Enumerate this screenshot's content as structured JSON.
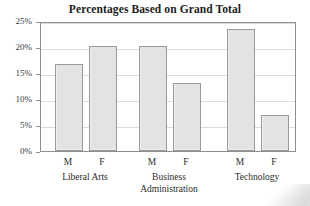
{
  "chart_data": {
    "type": "bar",
    "title": "Percentages Based on Grand Total",
    "xlabel": "",
    "ylabel": "",
    "ylim": [
      0,
      25
    ],
    "grid": true,
    "legend": "none",
    "categories": [
      "M",
      "F",
      "M",
      "F",
      "M",
      "F"
    ],
    "values": [
      16.8,
      20.1,
      20.1,
      13.0,
      23.4,
      7.0
    ],
    "groups": [
      {
        "label": "Liberal Arts",
        "bars": [
          {
            "label": "M",
            "value": 16.8
          },
          {
            "label": "F",
            "value": 20.1
          }
        ]
      },
      {
        "label": "Business Administration",
        "bars": [
          {
            "label": "M",
            "value": 20.1
          },
          {
            "label": "F",
            "value": 13.0
          }
        ]
      },
      {
        "label": "Technology",
        "bars": [
          {
            "label": "M",
            "value": 23.4
          },
          {
            "label": "F",
            "value": 7.0
          }
        ]
      }
    ],
    "ytick_labels": [
      "0%",
      "5%",
      "10%",
      "15%",
      "20%",
      "25%"
    ],
    "ytick_values": [
      0,
      5,
      10,
      15,
      20,
      25
    ],
    "bar_fill_color": "#e3e3e3",
    "bar_border_color": "#9a9a9a",
    "frame_color": "#8e8e8e",
    "grid_color": "#dcdcdc"
  },
  "axis": {
    "group_label_lines": [
      [
        "Liberal Arts"
      ],
      [
        "Business",
        "Administration"
      ],
      [
        "Technology"
      ]
    ]
  }
}
